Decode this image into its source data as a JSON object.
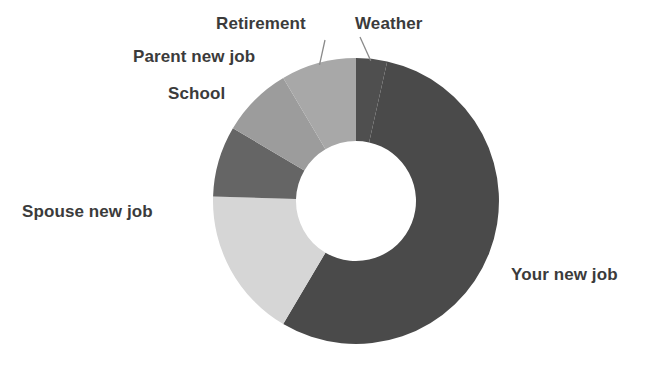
{
  "chart_data": {
    "type": "pie",
    "variant": "donut",
    "title": "",
    "subtitle": "",
    "xlabel": "",
    "ylabel": "",
    "legend": "none",
    "grid": false,
    "labels_position": "outside-with-leader-lines",
    "categories": [
      "Weather",
      "Your new job",
      "Spouse new job",
      "School",
      "Parent new job",
      "Retirement"
    ],
    "values": [
      3.5,
      55,
      17,
      8,
      8,
      8.5
    ],
    "units": "percent",
    "total": 100,
    "colors": [
      "#4f4f4f",
      "#4a4a4a",
      "#d6d6d6",
      "#656565",
      "#9c9c9c",
      "#a8a8a8"
    ],
    "start_angle_deg": 0,
    "direction": "clockwise",
    "inner_radius_ratio": 0.42,
    "slices": [
      {
        "label": "Weather",
        "value": 3.5,
        "color": "#4f4f4f",
        "start_deg": 0.0,
        "end_deg": 12.6,
        "leader_line": true,
        "label_side": "top"
      },
      {
        "label": "Your new job",
        "value": 55,
        "color": "#4a4a4a",
        "start_deg": 12.6,
        "end_deg": 210.6,
        "leader_line": false,
        "label_side": "right"
      },
      {
        "label": "Spouse new job",
        "value": 17,
        "color": "#d6d6d6",
        "start_deg": 210.6,
        "end_deg": 271.8,
        "leader_line": false,
        "label_side": "left"
      },
      {
        "label": "School",
        "value": 8,
        "color": "#656565",
        "start_deg": 271.8,
        "end_deg": 300.6,
        "leader_line": false,
        "label_side": "left"
      },
      {
        "label": "Parent new job",
        "value": 8,
        "color": "#9c9c9c",
        "start_deg": 300.6,
        "end_deg": 329.4,
        "leader_line": false,
        "label_side": "left"
      },
      {
        "label": "Retirement",
        "value": 8.5,
        "color": "#a8a8a8",
        "start_deg": 329.4,
        "end_deg": 360.0,
        "leader_line": true,
        "label_side": "top"
      }
    ]
  },
  "labels": {
    "retirement": "Retirement",
    "weather": "Weather",
    "parent_new_job": "Parent new job",
    "school": "School",
    "spouse_new_job": "Spouse new job",
    "your_new_job": "Your new job"
  },
  "style": {
    "background": "#ffffff",
    "text_color": "#3b3b3b",
    "leader_line_color": "#8a8a8a"
  },
  "geometry": {
    "center_x": 356,
    "center_y": 201,
    "outer_radius": 143,
    "inner_radius": 60
  }
}
